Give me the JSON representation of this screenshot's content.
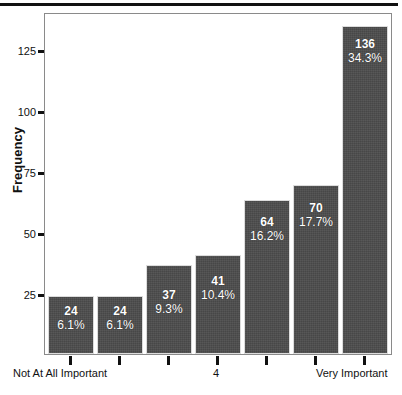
{
  "chart_data": {
    "type": "bar",
    "title": "",
    "xlabel": "",
    "ylabel": "Frequency",
    "ylim": [
      0,
      141
    ],
    "yticks": [
      25,
      50,
      75,
      100,
      125
    ],
    "grid": false,
    "legend": false,
    "categories": [
      "Not At All Important",
      "2",
      "3",
      "4",
      "5",
      "6",
      "Very Important"
    ],
    "tick_labels": [
      "Not At All Important",
      "",
      "",
      "4",
      "",
      "",
      "Very Important"
    ],
    "values": [
      24,
      24,
      37,
      41,
      64,
      70,
      136
    ],
    "bar_labels": [
      {
        "count": "24",
        "percent": "6.1%"
      },
      {
        "count": "24",
        "percent": "6.1%"
      },
      {
        "count": "37",
        "percent": "9.3%"
      },
      {
        "count": "41",
        "percent": "10.4%"
      },
      {
        "count": "64",
        "percent": "16.2%"
      },
      {
        "count": "70",
        "percent": "17.7%"
      },
      {
        "count": "136",
        "percent": "34.3%"
      }
    ],
    "percentages": [
      6.1,
      6.1,
      9.3,
      10.4,
      16.2,
      17.7,
      34.3
    ],
    "total": 396,
    "colors": {
      "bar_fill": "#4c4c4c",
      "bar_label_text": "#ffffff",
      "axis": "#111111",
      "frame": "#8a8a8a",
      "background": "#ffffff",
      "top_rule": "#111111"
    }
  }
}
